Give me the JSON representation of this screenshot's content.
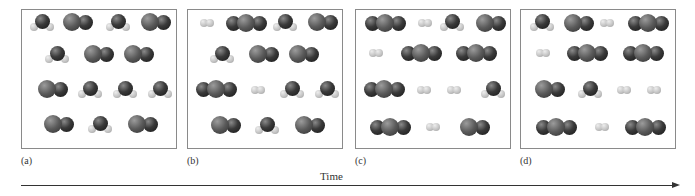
{
  "figure": {
    "axis": {
      "label": "Time",
      "direction": "left-to-right"
    },
    "legend_species": {
      "H2O": "dark O sphere with two light H spheres below",
      "CO": "gray C sphere fused with darker O sphere",
      "CO2": "gray C sphere flanked by two darker O spheres",
      "H2": "two small light-gray H spheres"
    },
    "colors": {
      "oxygen": "#2a2a2a",
      "carbon": "#5a5a5a",
      "hydrogen": "#c4c4c4",
      "frame": "#8a8a8a",
      "text": "#333333"
    },
    "panels": [
      {
        "label": "(a)",
        "left": 21,
        "molecules": [
          {
            "type": "H2O",
            "x": 42,
            "y": 22
          },
          {
            "type": "CO",
            "x": 77,
            "y": 22
          },
          {
            "type": "H2O",
            "x": 118,
            "y": 22
          },
          {
            "type": "CO",
            "x": 155,
            "y": 22
          },
          {
            "type": "H2O",
            "x": 57,
            "y": 54
          },
          {
            "type": "CO",
            "x": 98,
            "y": 54
          },
          {
            "type": "CO",
            "x": 138,
            "y": 54
          },
          {
            "type": "CO",
            "x": 52,
            "y": 89
          },
          {
            "type": "H2O",
            "x": 90,
            "y": 89
          },
          {
            "type": "H2O",
            "x": 125,
            "y": 89
          },
          {
            "type": "H2O",
            "x": 160,
            "y": 89
          },
          {
            "type": "CO",
            "x": 58,
            "y": 124
          },
          {
            "type": "H2O",
            "x": 100,
            "y": 124
          },
          {
            "type": "CO",
            "x": 142,
            "y": 124
          }
        ]
      },
      {
        "label": "(b)",
        "left": 187,
        "molecules": [
          {
            "type": "H2",
            "x": 207,
            "y": 23
          },
          {
            "type": "CO2",
            "x": 246,
            "y": 23
          },
          {
            "type": "H2O",
            "x": 285,
            "y": 22
          },
          {
            "type": "CO",
            "x": 322,
            "y": 22
          },
          {
            "type": "H2O",
            "x": 222,
            "y": 54
          },
          {
            "type": "CO",
            "x": 263,
            "y": 54
          },
          {
            "type": "CO",
            "x": 303,
            "y": 54
          },
          {
            "type": "CO2",
            "x": 216,
            "y": 89
          },
          {
            "type": "H2",
            "x": 258,
            "y": 90
          },
          {
            "type": "H2O",
            "x": 292,
            "y": 89
          },
          {
            "type": "H2O",
            "x": 327,
            "y": 89
          },
          {
            "type": "CO",
            "x": 225,
            "y": 125
          },
          {
            "type": "H2O",
            "x": 267,
            "y": 125
          },
          {
            "type": "CO",
            "x": 309,
            "y": 125
          }
        ]
      },
      {
        "label": "(c)",
        "left": 355,
        "molecules": [
          {
            "type": "CO2",
            "x": 385,
            "y": 23
          },
          {
            "type": "H2",
            "x": 425,
            "y": 23
          },
          {
            "type": "H2O",
            "x": 452,
            "y": 22
          },
          {
            "type": "CO",
            "x": 490,
            "y": 23
          },
          {
            "type": "H2",
            "x": 376,
            "y": 53
          },
          {
            "type": "CO2",
            "x": 421,
            "y": 53
          },
          {
            "type": "CO2",
            "x": 476,
            "y": 53
          },
          {
            "type": "CO2",
            "x": 384,
            "y": 89
          },
          {
            "type": "H2",
            "x": 424,
            "y": 90
          },
          {
            "type": "H2",
            "x": 454,
            "y": 90
          },
          {
            "type": "H2O",
            "x": 493,
            "y": 89
          },
          {
            "type": "CO2",
            "x": 390,
            "y": 127
          },
          {
            "type": "H2",
            "x": 433,
            "y": 127
          },
          {
            "type": "CO",
            "x": 474,
            "y": 127
          }
        ]
      },
      {
        "label": "(d)",
        "left": 520,
        "molecules": [
          {
            "type": "H2O",
            "x": 542,
            "y": 22
          },
          {
            "type": "CO",
            "x": 578,
            "y": 23
          },
          {
            "type": "H2",
            "x": 607,
            "y": 23
          },
          {
            "type": "CO2",
            "x": 648,
            "y": 23
          },
          {
            "type": "H2",
            "x": 543,
            "y": 53
          },
          {
            "type": "CO2",
            "x": 587,
            "y": 53
          },
          {
            "type": "CO2",
            "x": 643,
            "y": 53
          },
          {
            "type": "CO",
            "x": 549,
            "y": 89
          },
          {
            "type": "H2O",
            "x": 590,
            "y": 89
          },
          {
            "type": "H2",
            "x": 624,
            "y": 90
          },
          {
            "type": "H2",
            "x": 654,
            "y": 90
          },
          {
            "type": "CO2",
            "x": 556,
            "y": 127
          },
          {
            "type": "H2",
            "x": 602,
            "y": 127
          },
          {
            "type": "CO2",
            "x": 645,
            "y": 127
          }
        ]
      }
    ]
  }
}
